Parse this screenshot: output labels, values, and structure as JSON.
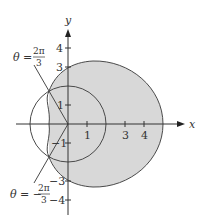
{
  "figure": {
    "axes": {
      "x_label": "x",
      "y_label": "y",
      "x_ticks": [
        "1",
        "3",
        "4"
      ],
      "y_ticks_pos": [
        "4",
        "3",
        "1"
      ],
      "y_ticks_neg": [
        "−1",
        "−3",
        "−4"
      ]
    },
    "curves": {
      "circle": "r = 2",
      "limacon": "r = 3 + 2cos θ"
    },
    "annotations": {
      "upper_theta_lhs": "θ =",
      "upper_theta_num": "2π",
      "upper_theta_den": "3",
      "lower_theta_lhs": "θ = −",
      "lower_theta_num": "2π",
      "lower_theta_den": "3"
    },
    "colors": {
      "shade": "#d8d8d8",
      "stroke": "#4a4a4a",
      "axis": "#333333"
    }
  }
}
